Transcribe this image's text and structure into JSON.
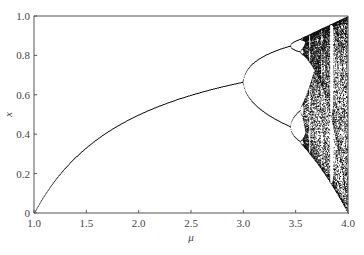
{
  "chart_data": {
    "type": "scatter",
    "title": "",
    "subtitle": "Bifurcation diagram of the logistic map x(n+1) = mu * x(n) * (1 - x(n))",
    "xlabel": "μ",
    "ylabel": "x",
    "xlim": [
      1.0,
      4.0
    ],
    "ylim": [
      0.0,
      1.0
    ],
    "xticks": [
      1.0,
      1.5,
      2.0,
      2.5,
      3.0,
      3.5,
      4.0
    ],
    "xtick_labels": [
      "1.0",
      "1.5",
      "2.0",
      "2.5",
      "3.0",
      "3.5",
      "4.0"
    ],
    "yticks": [
      0,
      0.2,
      0.4,
      0.6,
      0.8,
      1.0
    ],
    "ytick_labels": [
      "0",
      "0.2",
      "0.4",
      "0.6",
      "0.8",
      "1.0"
    ],
    "grid": false,
    "legend": "none",
    "series": [
      {
        "name": "logistic map attractor",
        "generator": "logistic",
        "mu_range": [
          1.0,
          4.0
        ],
        "mu_steps": 630,
        "transient_iterations": 300,
        "plotted_iterations": 120,
        "x0": 0.5,
        "color": "#111111"
      }
    ],
    "key_points": [
      {
        "mu": 1.0,
        "x": 0.0,
        "note": "stable fixed point begins"
      },
      {
        "mu": 2.0,
        "x": 0.5
      },
      {
        "mu": 3.0,
        "x": 0.667,
        "note": "first period-doubling bifurcation"
      },
      {
        "mu": 3.449,
        "x": [
          0.44,
          0.85
        ],
        "note": "second period-doubling"
      },
      {
        "mu": 3.57,
        "note": "onset of chaos"
      },
      {
        "mu": 4.0,
        "x": [
          0.0,
          1.0
        ],
        "note": "full chaotic band"
      }
    ]
  }
}
